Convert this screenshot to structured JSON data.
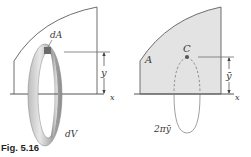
{
  "figure": {
    "caption": "Fig. 5.16",
    "left_panel": {
      "labels": {
        "area_element": "dA",
        "distance": "y",
        "axis": "x",
        "volume_element": "dV"
      }
    },
    "right_panel": {
      "labels": {
        "area": "A",
        "centroid": "C",
        "distance": "ȳ",
        "axis": "x",
        "path_length": "2πȳ"
      }
    },
    "colors": {
      "line": "#6e6e6e",
      "shaded_area": "#e3e3e3",
      "ring_light": "#cfcfcf",
      "ring_dark": "#8a8a8a",
      "element": "#6a6a6a",
      "centroid_dot": "#555555"
    }
  }
}
